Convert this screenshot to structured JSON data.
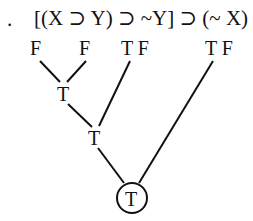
{
  "item_marker": ".",
  "formula": "[(X ⊃ Y) ⊃ ~Y] ⊃ (~ X)",
  "leaf_values": [
    {
      "label": "F",
      "x": 37
    },
    {
      "label": "F",
      "x": 86
    },
    {
      "label": "T F",
      "x": 134
    },
    {
      "label": "T F",
      "x": 230
    }
  ],
  "nodes": [
    {
      "label": "T",
      "x": 64,
      "y": 93
    },
    {
      "label": "T",
      "x": 95,
      "y": 137
    },
    {
      "label": "T",
      "x": 132,
      "y": 198,
      "circled": true
    }
  ],
  "colors": {
    "ink": "#111111",
    "background": "#ffffff"
  }
}
